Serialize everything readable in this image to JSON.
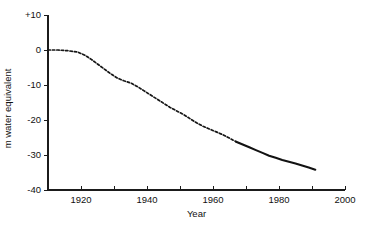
{
  "chart_data": {
    "type": "line",
    "title": "",
    "xlabel": "Year",
    "ylabel": "m water equivalent",
    "xlim": [
      1910,
      2000
    ],
    "ylim": [
      -40,
      10
    ],
    "grid": false,
    "legend": "none",
    "x_tick_labels": [
      "1920",
      "1940",
      "1960",
      "1980",
      "2000"
    ],
    "x_tick_values": [
      1920,
      1940,
      1960,
      1980,
      2000
    ],
    "x_minor_tick_values": [
      1910,
      1930,
      1950,
      1970,
      1990
    ],
    "y_tick_labels": [
      "+10",
      "0",
      "-10",
      "-20",
      "-30",
      "-40"
    ],
    "y_tick_values": [
      10,
      0,
      -10,
      -20,
      -30,
      -40
    ],
    "series": [
      {
        "name": "cumulative mass balance (reconstructed)",
        "style": "dashed",
        "x": [
          1910,
          1913,
          1916,
          1919,
          1921,
          1923,
          1925,
          1927,
          1929,
          1931,
          1933,
          1935,
          1937,
          1939,
          1941,
          1943,
          1945,
          1947,
          1949,
          1951,
          1953,
          1955,
          1957,
          1959,
          1961,
          1963,
          1965,
          1967
        ],
        "values": [
          0.0,
          0.0,
          -0.2,
          -0.6,
          -1.4,
          -2.6,
          -4.0,
          -5.4,
          -6.8,
          -8.0,
          -8.8,
          -9.4,
          -10.4,
          -11.6,
          -12.8,
          -14.0,
          -15.2,
          -16.4,
          -17.4,
          -18.4,
          -19.6,
          -20.8,
          -21.8,
          -22.6,
          -23.4,
          -24.2,
          -25.2,
          -26.2
        ]
      },
      {
        "name": "cumulative mass balance (measured)",
        "style": "solid",
        "x": [
          1967,
          1969,
          1971,
          1973,
          1975,
          1977,
          1979,
          1981,
          1983,
          1985,
          1987,
          1989,
          1991
        ],
        "values": [
          -26.2,
          -27.0,
          -27.8,
          -28.6,
          -29.4,
          -30.2,
          -30.8,
          -31.4,
          -31.9,
          -32.4,
          -33.0,
          -33.6,
          -34.2
        ]
      }
    ]
  }
}
